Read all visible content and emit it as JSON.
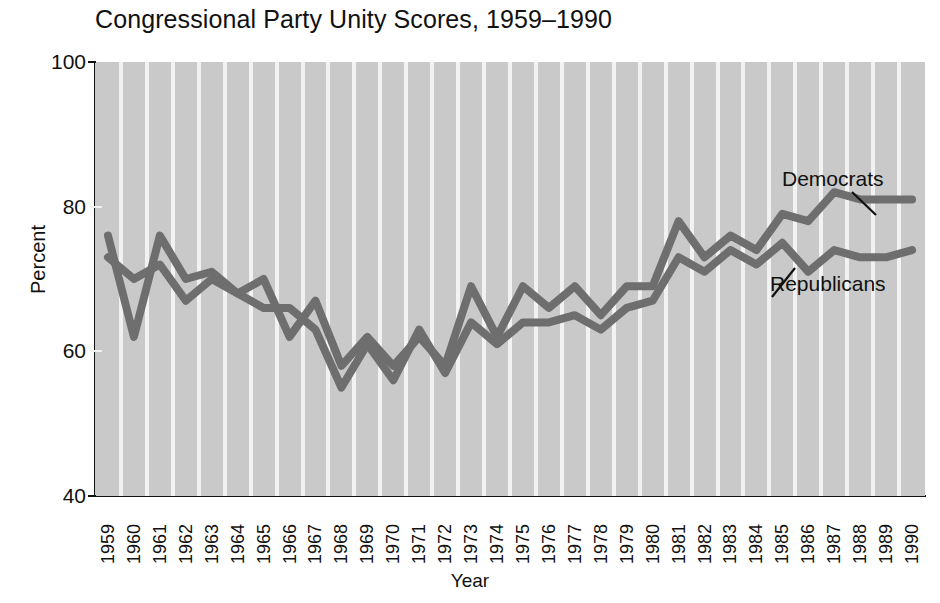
{
  "chart_data": {
    "type": "line",
    "title": "Congressional Party Unity Scores, 1959–1990",
    "xlabel": "Year",
    "ylabel": "Percent",
    "ylim": [
      40,
      100
    ],
    "yticks": [
      40,
      60,
      80,
      100
    ],
    "grid": "vertical-stripes",
    "legend_position": "inline-annotations",
    "categories": [
      "1959",
      "1960",
      "1961",
      "1962",
      "1963",
      "1964",
      "1965",
      "1966",
      "1967",
      "1968",
      "1969",
      "1970",
      "1971",
      "1972",
      "1973",
      "1974",
      "1975",
      "1976",
      "1977",
      "1978",
      "1979",
      "1980",
      "1981",
      "1982",
      "1983",
      "1984",
      "1985",
      "1986",
      "1987",
      "1988",
      "1989",
      "1990"
    ],
    "series": [
      {
        "name": "Democrats",
        "values": [
          76,
          62,
          76,
          70,
          71,
          68,
          70,
          62,
          67,
          58,
          62,
          58,
          62,
          58,
          69,
          62,
          69,
          66,
          69,
          65,
          69,
          69,
          78,
          73,
          76,
          74,
          79,
          78,
          82,
          81,
          81,
          81
        ]
      },
      {
        "name": "Republicans",
        "values": [
          73,
          70,
          72,
          67,
          70,
          68,
          66,
          66,
          63,
          55,
          61,
          56,
          63,
          57,
          64,
          61,
          64,
          64,
          65,
          63,
          66,
          67,
          73,
          71,
          74,
          72,
          75,
          71,
          74,
          73,
          73,
          74
        ]
      }
    ],
    "annotations": [
      {
        "text": "Democrats",
        "series": "Democrats"
      },
      {
        "text": "Republicans",
        "series": "Republicans"
      }
    ],
    "colors": {
      "line": "#6e6e6e",
      "plot_background": "#c9c9c9",
      "stripe": "#f2f2f2",
      "axis": "#111111",
      "text": "#111111"
    }
  }
}
